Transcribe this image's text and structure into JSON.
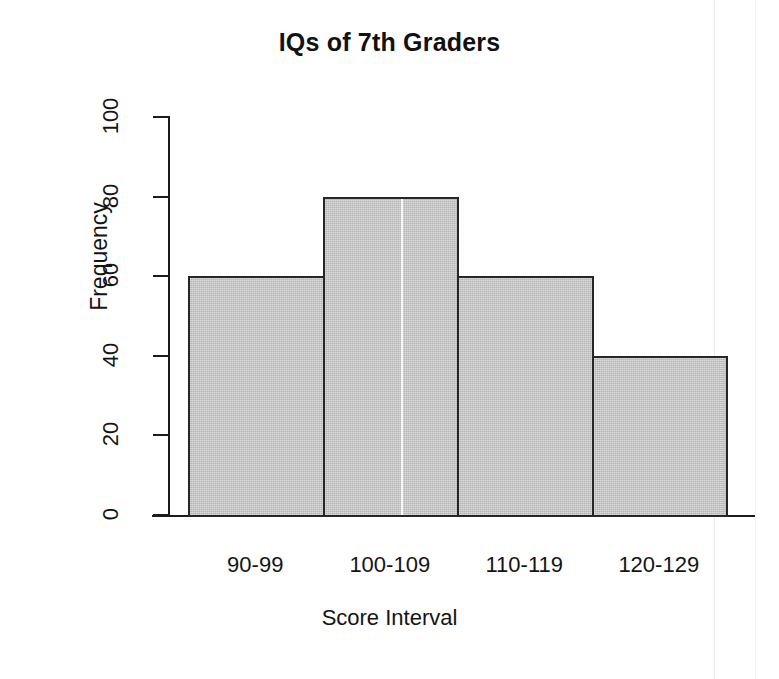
{
  "chart_data": {
    "type": "bar",
    "title": "IQs of 7th Graders",
    "xlabel": "Score Interval",
    "ylabel": "Frequency",
    "categories": [
      "90-99",
      "100-109",
      "110-119",
      "120-129"
    ],
    "values": [
      60,
      80,
      60,
      40
    ],
    "ylim": [
      0,
      100
    ],
    "yticks": [
      0,
      20,
      40,
      60,
      80,
      100
    ],
    "ytick_labels": [
      "0",
      "20",
      "40",
      "60",
      "80",
      "100"
    ],
    "grid": false,
    "legend": false,
    "bar_fill_color": "#c9c9c9",
    "bar_border_color": "#262626",
    "background_color": "#ffffff",
    "text_color": "#141414"
  },
  "figure": {
    "title": "IQs of 7th Graders",
    "x_axis_title": "Score Interval",
    "y_axis_title": "Frequency"
  }
}
